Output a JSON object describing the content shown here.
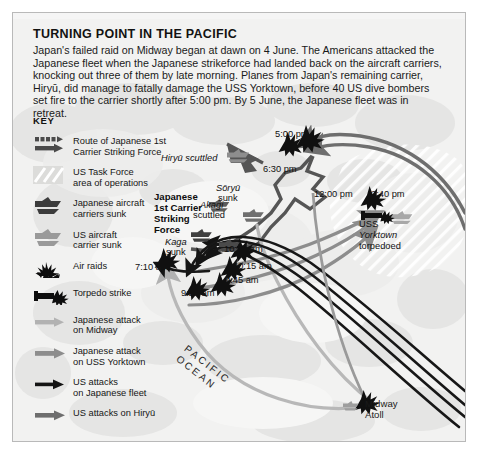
{
  "header": {
    "title": "TURNING POINT IN THE PACIFIC",
    "paragraph": "Japan's failed raid on Midway began at dawn on 4 June. The Americans attacked the Japanese fleet when the Japanese strikeforce had landed back on the aircraft carriers, knocking out three of them by late morning. Planes from Japan's remaining carrier, Hiryū, did manage to fatally damage the USS Yorktown, before 40 US dive bombers set fire to the carrier shortly after 5:00 pm. By 5 June, the Japanese fleet was in retreat.",
    "paragraph_lines": [
      "Japan's failed raid on Midway began at dawn on 4 June. The Americans attacked the",
      "Japanese fleet when the Japanese strikeforce had landed back on the aircraft carriers,",
      "knocking out three of them by late morning. Planes from Japan's remaining carrier, Hiryū,",
      "did manage to fatally damage the USS Yorktown, before 40 US dive bombers set fire to the",
      "carrier shortly after 5:00 pm. By 5 June, the Japanese fleet was in retreat."
    ]
  },
  "key": {
    "title": "KEY",
    "items": [
      {
        "icon": "dashed-route-arrow-icon",
        "label_line1": "Route of Japanese 1st",
        "label_line2": "Carrier Striking Force",
        "color": "#4a4a4a"
      },
      {
        "icon": "hatched-area-icon",
        "label_line1": "US Task Force",
        "label_line2": "area of operations",
        "color": "#ffffff"
      },
      {
        "icon": "japanese-carrier-sunk-icon",
        "label_line1": "Japanese aircraft",
        "label_line2": "carriers sunk",
        "color": "#3c3c3c"
      },
      {
        "icon": "us-carrier-sunk-icon",
        "label_line1": "US aircraft",
        "label_line2": "carrier sunk",
        "color": "#9a9a9a"
      },
      {
        "icon": "air-raid-icon",
        "label_line1": "Air raids",
        "label_line2": "",
        "color": "#0d0d0d"
      },
      {
        "icon": "torpedo-strike-icon",
        "label_line1": "Torpedo strike",
        "label_line2": "",
        "color": "#0d0d0d"
      },
      {
        "icon": "arrow-light-icon",
        "label_line1": "Japanese attack",
        "label_line2": "on Midway",
        "color": "#b2b2b2"
      },
      {
        "icon": "arrow-medium-icon",
        "label_line1": "Japanese attack",
        "label_line2": "on USS Yorktown",
        "color": "#8d8d8d"
      },
      {
        "icon": "arrow-black-icon",
        "label_line1": "US attacks",
        "label_line2": "on Japanese fleet",
        "color": "#141414"
      },
      {
        "icon": "arrow-dark-gray-icon",
        "label_line1": "US attacks on Hiryū",
        "label_line2": "",
        "color": "#6e6e6e"
      }
    ]
  },
  "map": {
    "force_label": {
      "line1": "Japanese",
      "line2": "1st Carrier",
      "line3": "Striking",
      "line4": "Force"
    },
    "ocean_label_line1": "PACIFIC",
    "ocean_label_line2": "OCEAN",
    "midway_line1": "Midway",
    "midway_line2": "Atoll",
    "labels": [
      {
        "name": "hiryu-scuttled",
        "text": "Hiryū scuttled",
        "x": 176,
        "y": 152,
        "italic_word": "Hiryū"
      },
      {
        "name": "soryu-sunk-line1",
        "text": "Sōryū",
        "x": 231,
        "y": 182,
        "italic": true
      },
      {
        "name": "soryu-sunk-line2",
        "text": "sunk",
        "x": 233,
        "y": 192,
        "italic": false
      },
      {
        "name": "akagi-scuttled-line1",
        "text": "Akagi",
        "x": 215,
        "y": 199,
        "italic": true
      },
      {
        "name": "akagi-scuttled-line2",
        "text": "scuttled",
        "x": 208,
        "y": 209,
        "italic": false
      },
      {
        "name": "kaga-sunk-line1",
        "text": "Kaga",
        "x": 180,
        "y": 236,
        "italic": true
      },
      {
        "name": "kaga-sunk-line2",
        "text": "sunk",
        "x": 181,
        "y": 246,
        "italic": false
      },
      {
        "name": "uss-yorktown-torpedoed-line1",
        "text": "USS",
        "x": 374,
        "y": 218,
        "italic": false
      },
      {
        "name": "uss-yorktown-torpedoed-line2",
        "text": "Yorktown",
        "x": 374,
        "y": 229,
        "italic": true
      },
      {
        "name": "uss-yorktown-torpedoed-line3",
        "text": "torpedoed",
        "x": 374,
        "y": 240,
        "italic": false
      }
    ],
    "times": [
      {
        "name": "time-5-00-pm",
        "text": "5:00 pm",
        "x": 274,
        "y": 128
      },
      {
        "name": "time-6-30-pm",
        "text": "6:30 pm",
        "x": 264,
        "y": 163
      },
      {
        "name": "time-12-00-pm",
        "text": "12:00 pm",
        "x": 329,
        "y": 188
      },
      {
        "name": "time-2-40-pm",
        "text": "2:40 pm",
        "x": 386,
        "y": 188
      },
      {
        "name": "time-10-25-am",
        "text": "10:25 am",
        "x": 239,
        "y": 243
      },
      {
        "name": "time-10-15-am",
        "text": "10:15 am",
        "x": 248,
        "y": 260
      },
      {
        "name": "time-9-45-am",
        "text": "9:45 am",
        "x": 240,
        "y": 274
      },
      {
        "name": "time-9-28-am",
        "text": "9:28 am",
        "x": 196,
        "y": 287
      },
      {
        "name": "time-7-10-am",
        "text": "7:10 am",
        "x": 150,
        "y": 261
      }
    ]
  },
  "colors": {
    "page_background": "#ffffff",
    "map_background": "#f1f1f0",
    "frame_border": "#b9b9b9",
    "japanese_route": "#4a4a4a",
    "japanese_attack_midway": "#b2b2b2",
    "japanese_attack_yorktown": "#8d8d8d",
    "us_attack_fleet": "#141414",
    "us_attack_hiryu": "#6e6e6e",
    "text": "#121212"
  }
}
